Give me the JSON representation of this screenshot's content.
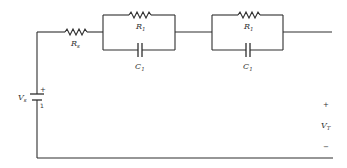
{
  "diagram": {
    "type": "circuit-schematic",
    "components": {
      "source": {
        "label": "V",
        "subscript": "s",
        "plus": "+",
        "minus": "1"
      },
      "series_resistor": {
        "label": "R",
        "subscript": "s"
      },
      "rc1": {
        "resistor": {
          "label": "R",
          "subscript": "1"
        },
        "capacitor": {
          "label": "C",
          "subscript": "1"
        }
      },
      "rc2": {
        "resistor": {
          "label": "R",
          "subscript": "1"
        },
        "capacitor": {
          "label": "C",
          "subscript": "1"
        }
      }
    },
    "terminal": {
      "plus": "+",
      "label": "V",
      "subscript": "T",
      "minus": "−"
    },
    "colors": {
      "line": "#2e2e2e",
      "text": "#333333",
      "background": "#ffffff"
    }
  }
}
